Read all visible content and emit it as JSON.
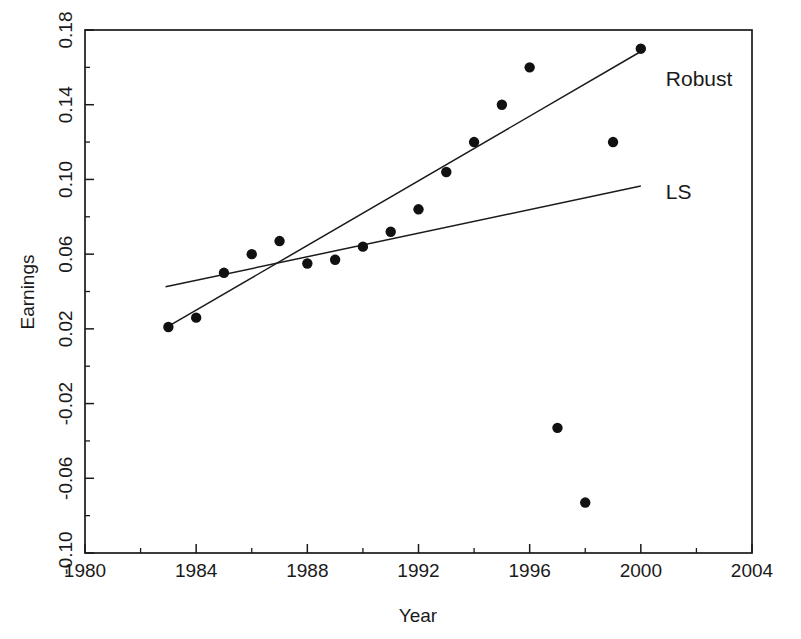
{
  "chart_data": {
    "type": "scatter",
    "title": "",
    "xlabel": "Year",
    "ylabel": "Earnings",
    "xlim": [
      1980,
      2004
    ],
    "ylim": [
      -0.1,
      0.18
    ],
    "grid": false,
    "legend_position": "inline-right",
    "x_ticks": [
      1980,
      1984,
      1988,
      1992,
      1996,
      2000,
      2004
    ],
    "x_tick_labels": [
      "1980",
      "1984",
      "1988",
      "1992",
      "1996",
      "2000",
      "2004"
    ],
    "x_minor_ticks": [
      1982,
      1986,
      1990,
      1994,
      1998,
      2002
    ],
    "y_ticks": [
      -0.1,
      -0.06,
      -0.02,
      0.02,
      0.06,
      0.1,
      0.14,
      0.18
    ],
    "y_tick_labels": [
      "-0.10",
      "-0.06",
      "-0.02",
      "0.02",
      "0.06",
      "0.10",
      "0.14",
      "0.18"
    ],
    "y_minor_ticks": [
      -0.08,
      -0.04,
      0.0,
      0.04,
      0.08,
      0.12,
      0.16
    ],
    "points": [
      {
        "x": 1983.0,
        "y": 0.021
      },
      {
        "x": 1984.0,
        "y": 0.026
      },
      {
        "x": 1985.0,
        "y": 0.05
      },
      {
        "x": 1986.0,
        "y": 0.06
      },
      {
        "x": 1987.0,
        "y": 0.067
      },
      {
        "x": 1988.0,
        "y": 0.055
      },
      {
        "x": 1989.0,
        "y": 0.057
      },
      {
        "x": 1990.0,
        "y": 0.064
      },
      {
        "x": 1991.0,
        "y": 0.072
      },
      {
        "x": 1992.0,
        "y": 0.084
      },
      {
        "x": 1993.0,
        "y": 0.104
      },
      {
        "x": 1994.0,
        "y": 0.12
      },
      {
        "x": 1995.0,
        "y": 0.14
      },
      {
        "x": 1996.0,
        "y": 0.16
      },
      {
        "x": 1997.0,
        "y": -0.033
      },
      {
        "x": 1998.0,
        "y": -0.073
      },
      {
        "x": 1999.0,
        "y": 0.12
      },
      {
        "x": 2000.0,
        "y": 0.17
      }
    ],
    "series": [
      {
        "name": "Robust",
        "type": "line",
        "label": "Robust",
        "x": [
          1982.9,
          2000.0
        ],
        "values": [
          0.0205,
          0.1685
        ],
        "label_x": 2000.9,
        "label_y": 0.1535
      },
      {
        "name": "LS",
        "type": "line",
        "label": "LS",
        "x": [
          1982.9,
          2000.0
        ],
        "values": [
          0.0425,
          0.0965
        ],
        "label_x": 2000.9,
        "label_y": 0.0935
      }
    ]
  },
  "axes": {
    "ylabel": "Earnings",
    "xlabel": "Year"
  }
}
